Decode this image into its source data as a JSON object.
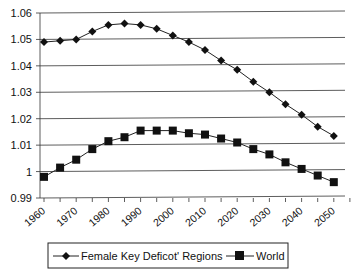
{
  "chart_data": {
    "type": "line",
    "title": "",
    "xlabel": "",
    "ylabel": "",
    "ylim": [
      0.99,
      1.06
    ],
    "yticks": [
      "0.99",
      "1",
      "1.01",
      "1.02",
      "1.03",
      "1.04",
      "1.05",
      "1.06"
    ],
    "xtick_labels": [
      "1960",
      "1970",
      "1980",
      "1990",
      "2000",
      "2010",
      "2020",
      "2030",
      "2040",
      "2050"
    ],
    "x": [
      1960,
      1965,
      1970,
      1975,
      1980,
      1985,
      1990,
      1995,
      2000,
      2005,
      2010,
      2015,
      2020,
      2025,
      2030,
      2035,
      2040,
      2045,
      2050
    ],
    "grid": true,
    "legend_position": "bottom",
    "series": [
      {
        "name": "Female Key Deficot' Regions",
        "marker": "diamond",
        "values": [
          1.049,
          1.0495,
          1.05,
          1.053,
          1.0555,
          1.056,
          1.0555,
          1.054,
          1.0515,
          1.049,
          1.046,
          1.042,
          1.0385,
          1.034,
          1.03,
          1.0255,
          1.0215,
          1.017,
          1.0135
        ]
      },
      {
        "name": "World",
        "marker": "square",
        "values": [
          0.998,
          1.0015,
          1.0045,
          1.0085,
          1.0115,
          1.013,
          1.0155,
          1.0155,
          1.0155,
          1.0145,
          1.014,
          1.0125,
          1.011,
          1.0085,
          1.0065,
          1.0035,
          1.001,
          0.9985,
          0.996
        ]
      }
    ]
  },
  "legend": {
    "series0": "Female Key Deficot' Regions",
    "series1": "World"
  }
}
